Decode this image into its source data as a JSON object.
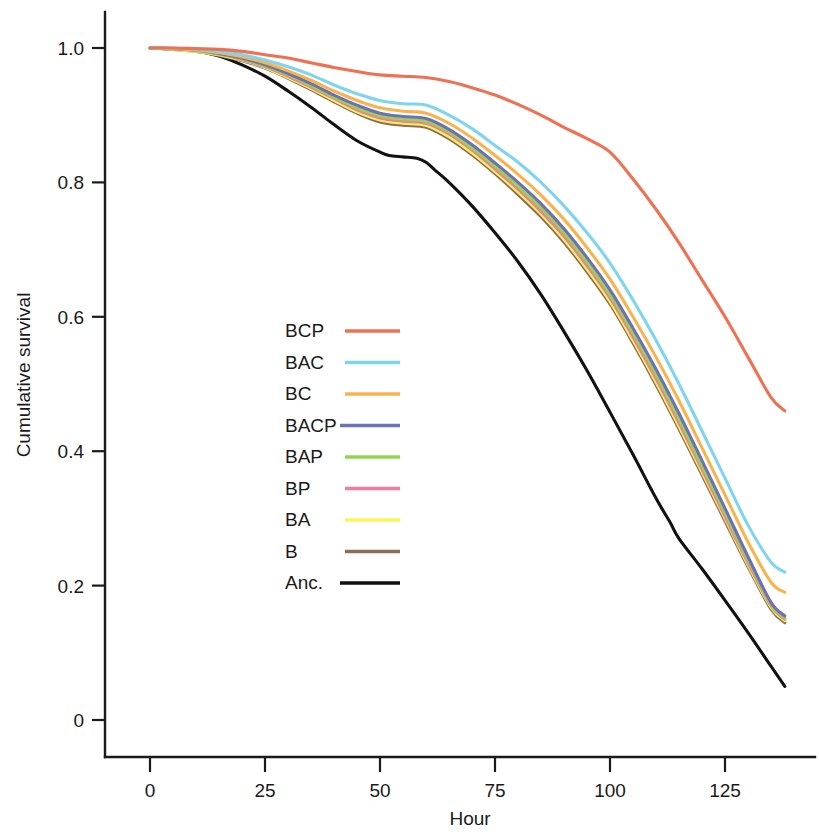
{
  "chart_data": {
    "type": "line",
    "title": "",
    "xlabel": "Hour",
    "ylabel": "Cumulative survival",
    "xlim": [
      0,
      140
    ],
    "ylim": [
      0,
      1.05
    ],
    "xticks": [
      0,
      25,
      50,
      75,
      100,
      125
    ],
    "xtick_labels": [
      "0",
      "25",
      "50",
      "75",
      "100",
      "125"
    ],
    "yticks": [
      0,
      0.2,
      0.4,
      0.6,
      0.8,
      1.0
    ],
    "ytick_labels": [
      "0",
      "0.2",
      "0.4",
      "0.6",
      "0.8",
      "1.0"
    ],
    "grid": false,
    "legend_position": "center-left-inside",
    "series": [
      {
        "name": "BCP",
        "color": "#ef7153",
        "x": [
          0,
          5,
          10,
          15,
          20,
          25,
          30,
          35,
          40,
          45,
          50,
          55,
          60,
          65,
          70,
          75,
          80,
          85,
          90,
          95,
          100,
          105,
          110,
          115,
          120,
          125,
          130,
          135,
          138
        ],
        "y": [
          1.0,
          1.0,
          0.999,
          0.998,
          0.995,
          0.99,
          0.985,
          0.978,
          0.971,
          0.965,
          0.96,
          0.958,
          0.956,
          0.95,
          0.941,
          0.93,
          0.916,
          0.9,
          0.882,
          0.865,
          0.845,
          0.805,
          0.76,
          0.71,
          0.655,
          0.6,
          0.54,
          0.48,
          0.46
        ]
      },
      {
        "name": "BAC",
        "color": "#7fd4ee",
        "x": [
          0,
          5,
          10,
          15,
          20,
          25,
          30,
          35,
          40,
          45,
          50,
          55,
          60,
          65,
          70,
          75,
          80,
          85,
          90,
          95,
          100,
          105,
          110,
          115,
          120,
          125,
          130,
          135,
          138
        ],
        "y": [
          1.0,
          1.0,
          0.998,
          0.995,
          0.99,
          0.982,
          0.972,
          0.96,
          0.945,
          0.932,
          0.922,
          0.917,
          0.915,
          0.9,
          0.88,
          0.855,
          0.83,
          0.8,
          0.765,
          0.725,
          0.68,
          0.625,
          0.565,
          0.5,
          0.43,
          0.36,
          0.29,
          0.235,
          0.22
        ]
      },
      {
        "name": "BC",
        "color": "#f5b košice"
      },
      {
        "name": "BC",
        "color": "#f6b martyr"
      }
    ],
    "series_full": [
      {
        "name": "BCP",
        "color": "#ef7153",
        "end_value": 0.46,
        "x": [
          0,
          5,
          10,
          15,
          20,
          25,
          30,
          35,
          40,
          45,
          50,
          55,
          60,
          65,
          70,
          75,
          80,
          85,
          90,
          95,
          100,
          105,
          110,
          115,
          120,
          125,
          130,
          135,
          138
        ],
        "y": [
          1.0,
          1.0,
          0.999,
          0.998,
          0.995,
          0.99,
          0.985,
          0.978,
          0.971,
          0.965,
          0.96,
          0.958,
          0.956,
          0.95,
          0.941,
          0.93,
          0.916,
          0.9,
          0.882,
          0.865,
          0.845,
          0.805,
          0.76,
          0.71,
          0.655,
          0.6,
          0.54,
          0.48,
          0.46
        ]
      },
      {
        "name": "BAC",
        "color": "#7fd4ee",
        "end_value": 0.22,
        "x": [
          0,
          5,
          10,
          15,
          20,
          25,
          30,
          35,
          40,
          45,
          50,
          55,
          60,
          65,
          70,
          75,
          80,
          85,
          90,
          95,
          100,
          105,
          110,
          115,
          120,
          125,
          130,
          135,
          138
        ],
        "y": [
          1.0,
          1.0,
          0.998,
          0.995,
          0.99,
          0.982,
          0.972,
          0.96,
          0.945,
          0.932,
          0.922,
          0.917,
          0.915,
          0.9,
          0.88,
          0.855,
          0.83,
          0.8,
          0.765,
          0.725,
          0.68,
          0.625,
          0.565,
          0.5,
          0.43,
          0.36,
          0.29,
          0.235,
          0.22
        ]
      },
      {
        "name": "BC",
        "color": "#f7b44c",
        "end_value": 0.19,
        "x": [
          0,
          5,
          10,
          15,
          20,
          25,
          30,
          35,
          40,
          45,
          50,
          55,
          60,
          65,
          70,
          75,
          80,
          85,
          90,
          95,
          100,
          105,
          110,
          115,
          120,
          125,
          130,
          135,
          138
        ],
        "y": [
          1.0,
          0.999,
          0.997,
          0.993,
          0.987,
          0.978,
          0.966,
          0.952,
          0.936,
          0.922,
          0.911,
          0.906,
          0.903,
          0.888,
          0.866,
          0.84,
          0.812,
          0.781,
          0.745,
          0.703,
          0.656,
          0.6,
          0.54,
          0.475,
          0.405,
          0.335,
          0.265,
          0.205,
          0.19
        ]
      },
      {
        "name": "BACP",
        "color": "#6f6fb8",
        "end_value": 0.155,
        "x": [
          0,
          5,
          10,
          15,
          20,
          25,
          30,
          35,
          40,
          45,
          50,
          55,
          60,
          65,
          70,
          75,
          80,
          85,
          90,
          95,
          100,
          105,
          110,
          115,
          120,
          125,
          130,
          135,
          138
        ],
        "y": [
          1.0,
          0.999,
          0.997,
          0.992,
          0.985,
          0.975,
          0.962,
          0.947,
          0.93,
          0.915,
          0.903,
          0.898,
          0.895,
          0.879,
          0.856,
          0.829,
          0.8,
          0.768,
          0.731,
          0.688,
          0.64,
          0.583,
          0.522,
          0.456,
          0.386,
          0.315,
          0.243,
          0.175,
          0.155
        ]
      },
      {
        "name": "BAP",
        "color": "#96d44f",
        "end_value": 0.152,
        "x": [
          0,
          5,
          10,
          15,
          20,
          25,
          30,
          35,
          40,
          45,
          50,
          55,
          60,
          65,
          70,
          75,
          80,
          85,
          90,
          95,
          100,
          105,
          110,
          115,
          120,
          125,
          130,
          135,
          138
        ],
        "y": [
          1.0,
          0.999,
          0.996,
          0.991,
          0.984,
          0.973,
          0.96,
          0.944,
          0.927,
          0.911,
          0.899,
          0.894,
          0.891,
          0.875,
          0.851,
          0.824,
          0.794,
          0.762,
          0.725,
          0.681,
          0.633,
          0.576,
          0.514,
          0.448,
          0.378,
          0.308,
          0.238,
          0.172,
          0.152
        ]
      },
      {
        "name": "BP",
        "color": "#f47ba0",
        "end_value": 0.15,
        "x": [
          0,
          5,
          10,
          15,
          20,
          25,
          30,
          35,
          40,
          45,
          50,
          55,
          60,
          65,
          70,
          75,
          80,
          85,
          90,
          95,
          100,
          105,
          110,
          115,
          120,
          125,
          130,
          135,
          138
        ],
        "y": [
          1.0,
          0.999,
          0.996,
          0.991,
          0.983,
          0.972,
          0.958,
          0.942,
          0.925,
          0.908,
          0.896,
          0.891,
          0.888,
          0.872,
          0.848,
          0.82,
          0.79,
          0.757,
          0.72,
          0.676,
          0.628,
          0.57,
          0.508,
          0.442,
          0.373,
          0.303,
          0.234,
          0.17,
          0.15
        ]
      },
      {
        "name": "BA",
        "color": "#fbf55c",
        "end_value": 0.148,
        "x": [
          0,
          5,
          10,
          15,
          20,
          25,
          30,
          35,
          40,
          45,
          50,
          55,
          60,
          65,
          70,
          75,
          80,
          85,
          90,
          95,
          100,
          105,
          110,
          115,
          120,
          125,
          130,
          135,
          138
        ],
        "y": [
          1.0,
          0.998,
          0.995,
          0.99,
          0.982,
          0.971,
          0.956,
          0.94,
          0.922,
          0.905,
          0.893,
          0.888,
          0.885,
          0.868,
          0.844,
          0.816,
          0.786,
          0.753,
          0.715,
          0.671,
          0.623,
          0.565,
          0.503,
          0.437,
          0.369,
          0.3,
          0.231,
          0.168,
          0.148
        ]
      },
      {
        "name": "B",
        "color": "#8d6e52",
        "end_value": 0.145,
        "x": [
          0,
          5,
          10,
          15,
          20,
          25,
          30,
          35,
          40,
          45,
          50,
          55,
          60,
          65,
          70,
          75,
          80,
          85,
          90,
          95,
          100,
          105,
          110,
          115,
          120,
          125,
          130,
          135,
          138
        ],
        "y": [
          1.0,
          0.998,
          0.995,
          0.989,
          0.981,
          0.97,
          0.955,
          0.938,
          0.92,
          0.903,
          0.89,
          0.885,
          0.882,
          0.865,
          0.841,
          0.813,
          0.782,
          0.749,
          0.711,
          0.667,
          0.619,
          0.561,
          0.499,
          0.433,
          0.365,
          0.296,
          0.228,
          0.165,
          0.145
        ]
      },
      {
        "name": "Anc.",
        "color": "#111111",
        "end_value": 0.05,
        "x": [
          0,
          5,
          10,
          15,
          20,
          25,
          30,
          35,
          40,
          45,
          50,
          52,
          55,
          58,
          60,
          62,
          65,
          70,
          75,
          80,
          85,
          90,
          95,
          100,
          105,
          110,
          113,
          115,
          120,
          125,
          130,
          135,
          138
        ],
        "y": [
          1.0,
          0.999,
          0.996,
          0.988,
          0.975,
          0.958,
          0.936,
          0.912,
          0.886,
          0.862,
          0.845,
          0.84,
          0.838,
          0.836,
          0.83,
          0.818,
          0.8,
          0.765,
          0.725,
          0.682,
          0.633,
          0.578,
          0.52,
          0.458,
          0.395,
          0.33,
          0.295,
          0.27,
          0.225,
          0.178,
          0.13,
          0.08,
          0.05
        ]
      }
    ]
  },
  "axes": {
    "y_title": "Cumulative survival",
    "x_title": "Hour",
    "y_tick_labels": [
      "1.0",
      "0.8",
      "0.6",
      "0.4",
      "0.2",
      "0"
    ],
    "x_tick_labels": [
      "0",
      "25",
      "50",
      "75",
      "100",
      "125"
    ]
  },
  "legend": {
    "entries": [
      {
        "label": "BCP",
        "color": "#ef7153"
      },
      {
        "label": "BAC",
        "color": "#7fd4ee"
      },
      {
        "label": "BC",
        "color": "#f7b44c"
      },
      {
        "label": "BACP",
        "color": "#6f6fb8"
      },
      {
        "label": "BAP",
        "color": "#96d44f"
      },
      {
        "label": "BP",
        "color": "#f47ba0"
      },
      {
        "label": "BA",
        "color": "#fbf55c"
      },
      {
        "label": "B",
        "color": "#8d6e52"
      },
      {
        "label": "Anc.",
        "color": "#111111"
      }
    ]
  }
}
